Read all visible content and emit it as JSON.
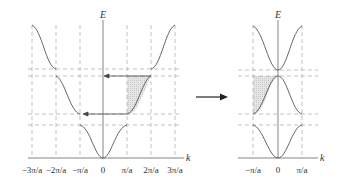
{
  "left_diagram": {
    "axis_labels": {
      "y": "E",
      "x": "k"
    },
    "tick_labels": [
      "−3π/a",
      "−2π/a",
      "−π/a",
      "0",
      "π/a",
      "2π/a",
      "3π/a"
    ],
    "description": "Extended zone scheme: energy bands E(k) plotted over −3π/a to 3π/a with band gaps at ±π/a and ±2π/a; shaded region of 2nd band (π/a to 2π/a) translated by arrows to first Brillouin zone"
  },
  "transform_arrow": {
    "direction": "right"
  },
  "right_diagram": {
    "axis_labels": {
      "y": "E",
      "x": "k"
    },
    "tick_labels": [
      "−π/a",
      "0",
      "π/a"
    ],
    "description": "Reduced zone scheme: three bands folded into first Brillouin zone −π/a to π/a; shaded region placed between −π/a and 0"
  },
  "colors": {
    "curve": "#555555",
    "dashed": "#a0a0a0",
    "shade": "#dcdcdc",
    "axis": "#666666"
  }
}
